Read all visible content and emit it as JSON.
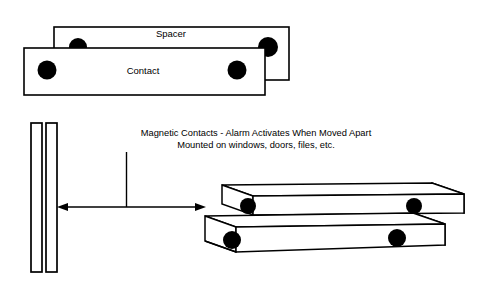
{
  "diagram": {
    "background_color": "#ffffff",
    "line_color": "#000000",
    "magnet_dot_color": "#000000",
    "labels": {
      "spacer": "Spacer",
      "contact": "Contact"
    },
    "caption": {
      "line1": "Magnetic Contacts - Alarm Activates When Moved Apart",
      "line2": "Mounted on windows, doors, files, etc."
    },
    "parts": {
      "top_view": {
        "spacer_bar": {
          "label": "Spacer",
          "magnet_dot_count": 2
        },
        "contact_bar": {
          "label": "Contact",
          "magnet_dot_count": 2
        }
      },
      "mounting_plates": {
        "name": "door-jamb-plates",
        "plate_count": 2
      },
      "perspective_view": {
        "back_bar": {
          "name": "spacer-bar-3d",
          "magnet_dot_count": 2
        },
        "front_bar": {
          "name": "contact-bar-3d",
          "magnet_dot_count": 2
        }
      },
      "separation_arrow": {
        "name": "separation-gap-arrow",
        "style": "double-headed"
      }
    }
  }
}
